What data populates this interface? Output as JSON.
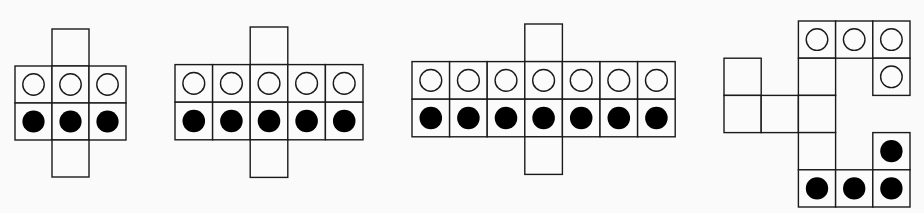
{
  "colors": {
    "background": "#fafafa",
    "stroke": "#1a1a1a",
    "fill_white": "#fbfbfb",
    "fill_black": "#000000"
  },
  "figures": [
    {
      "name": "figure-1",
      "origin": [
        15,
        29
      ],
      "cell": 37,
      "cells": [
        {
          "c": 1,
          "r": 0,
          "dot": "none"
        },
        {
          "c": 0,
          "r": 1,
          "dot": "white"
        },
        {
          "c": 1,
          "r": 1,
          "dot": "white"
        },
        {
          "c": 2,
          "r": 1,
          "dot": "white"
        },
        {
          "c": 0,
          "r": 2,
          "dot": "black"
        },
        {
          "c": 1,
          "r": 2,
          "dot": "black"
        },
        {
          "c": 2,
          "r": 2,
          "dot": "black"
        },
        {
          "c": 1,
          "r": 3,
          "dot": "none"
        }
      ]
    },
    {
      "name": "figure-2",
      "origin": [
        175,
        27
      ],
      "cell": 37.6,
      "cells": [
        {
          "c": 2,
          "r": 0,
          "dot": "none"
        },
        {
          "c": 0,
          "r": 1,
          "dot": "white"
        },
        {
          "c": 1,
          "r": 1,
          "dot": "white"
        },
        {
          "c": 2,
          "r": 1,
          "dot": "white"
        },
        {
          "c": 3,
          "r": 1,
          "dot": "white"
        },
        {
          "c": 4,
          "r": 1,
          "dot": "white"
        },
        {
          "c": 0,
          "r": 2,
          "dot": "black"
        },
        {
          "c": 1,
          "r": 2,
          "dot": "black"
        },
        {
          "c": 2,
          "r": 2,
          "dot": "black"
        },
        {
          "c": 3,
          "r": 2,
          "dot": "black"
        },
        {
          "c": 4,
          "r": 2,
          "dot": "black"
        },
        {
          "c": 2,
          "r": 3,
          "dot": "none"
        }
      ]
    },
    {
      "name": "figure-3",
      "origin": [
        412,
        24
      ],
      "cell": 37.6,
      "cells": [
        {
          "c": 3,
          "r": 0,
          "dot": "none"
        },
        {
          "c": 0,
          "r": 1,
          "dot": "white"
        },
        {
          "c": 1,
          "r": 1,
          "dot": "white"
        },
        {
          "c": 2,
          "r": 1,
          "dot": "white"
        },
        {
          "c": 3,
          "r": 1,
          "dot": "white"
        },
        {
          "c": 4,
          "r": 1,
          "dot": "white"
        },
        {
          "c": 5,
          "r": 1,
          "dot": "white"
        },
        {
          "c": 6,
          "r": 1,
          "dot": "white"
        },
        {
          "c": 0,
          "r": 2,
          "dot": "black"
        },
        {
          "c": 1,
          "r": 2,
          "dot": "black"
        },
        {
          "c": 2,
          "r": 2,
          "dot": "black"
        },
        {
          "c": 3,
          "r": 2,
          "dot": "black"
        },
        {
          "c": 4,
          "r": 2,
          "dot": "black"
        },
        {
          "c": 5,
          "r": 2,
          "dot": "black"
        },
        {
          "c": 6,
          "r": 2,
          "dot": "black"
        },
        {
          "c": 3,
          "r": 3,
          "dot": "none"
        }
      ]
    },
    {
      "name": "figure-4",
      "origin": [
        724,
        21
      ],
      "cell": 37.2,
      "cells": [
        {
          "c": 2,
          "r": 0,
          "dot": "white"
        },
        {
          "c": 3,
          "r": 0,
          "dot": "white"
        },
        {
          "c": 4,
          "r": 0,
          "dot": "white"
        },
        {
          "c": 0,
          "r": 1,
          "dot": "none"
        },
        {
          "c": 2,
          "r": 1,
          "dot": "none"
        },
        {
          "c": 4,
          "r": 1,
          "dot": "white"
        },
        {
          "c": 0,
          "r": 2,
          "dot": "none"
        },
        {
          "c": 1,
          "r": 2,
          "dot": "none"
        },
        {
          "c": 2,
          "r": 2,
          "dot": "none"
        },
        {
          "c": 2,
          "r": 3,
          "dot": "none"
        },
        {
          "c": 4,
          "r": 3,
          "dot": "black"
        },
        {
          "c": 2,
          "r": 4,
          "dot": "black"
        },
        {
          "c": 3,
          "r": 4,
          "dot": "black"
        },
        {
          "c": 4,
          "r": 4,
          "dot": "black"
        }
      ]
    }
  ]
}
